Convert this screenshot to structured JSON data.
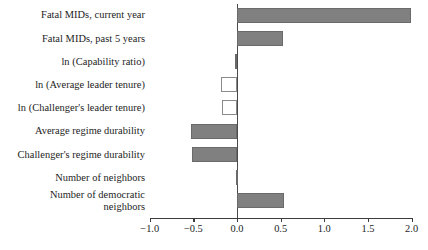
{
  "chart_data": {
    "type": "bar",
    "orientation": "horizontal",
    "title": "",
    "subtitle": "",
    "xlabel": "",
    "ylabel": "",
    "grid": false,
    "legend": null,
    "xlim": [
      -1.15,
      2.1
    ],
    "xticks": [
      "-1.0",
      "-0.5",
      "0.0",
      "0.5",
      "1.0",
      "1.5",
      "2.0"
    ],
    "xtick_values": [
      -1.0,
      -0.5,
      0.0,
      0.5,
      1.0,
      1.5,
      2.0
    ],
    "categories": [
      "Fatal MIDs, current year",
      "Fatal MIDs, past 5 years",
      "ln (Capability ratio)",
      "ln (Average leader tenure)",
      "ln (Challenger's leader tenure)",
      "Average regime durability",
      "Challenger's regime durability",
      "Number of neighbors",
      "Number of democratic\nneighbors"
    ],
    "values": [
      1.99,
      0.53,
      -0.02,
      -0.18,
      -0.17,
      -0.53,
      -0.52,
      -0.01,
      0.54
    ],
    "bar_styles": [
      "filled",
      "filled",
      "filled",
      "hollow",
      "hollow",
      "filled",
      "filled",
      "filled",
      "filled"
    ],
    "colors": {
      "bar_fill": "#808080",
      "bar_edge": "#6a6a6a",
      "hollow_fill": "#ffffff",
      "hollow_edge": "#8a8a8a",
      "axis": "#3c3c3c",
      "zero_line": "#4a4a4a",
      "text": "#1c1c1c",
      "background": "#ffffff"
    }
  }
}
